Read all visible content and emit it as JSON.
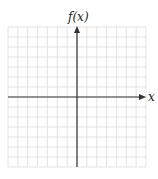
{
  "diagram": {
    "type": "coordinate-grid",
    "y_axis_label": "f(x)",
    "x_axis_label": "x",
    "grid": {
      "columns": 14,
      "rows": 14
    },
    "colors": {
      "grid": "#dcdcdc",
      "axis": "#333333",
      "background": "#ffffff"
    }
  }
}
